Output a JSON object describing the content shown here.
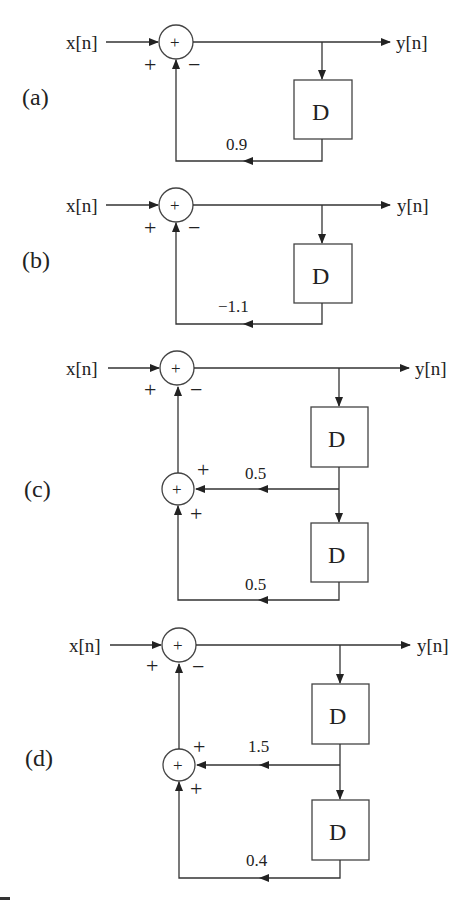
{
  "diagrams": [
    {
      "id": "a",
      "label": "(a)",
      "input": "x[n]",
      "output": "y[n]",
      "top_sum": {
        "plus": "+",
        "minus": "−",
        "glyph": "+"
      },
      "delays": [
        "D"
      ],
      "gains": [
        "0.9"
      ]
    },
    {
      "id": "b",
      "label": "(b)",
      "input": "x[n]",
      "output": "y[n]",
      "top_sum": {
        "plus": "+",
        "minus": "−",
        "glyph": "+"
      },
      "delays": [
        "D"
      ],
      "gains": [
        "−1.1"
      ]
    },
    {
      "id": "c",
      "label": "(c)",
      "input": "x[n]",
      "output": "y[n]",
      "top_sum": {
        "plus": "+",
        "minus": "−",
        "glyph": "+"
      },
      "inner_sum": {
        "plus_top": "+",
        "plus_bottom": "+",
        "glyph": "+"
      },
      "delays": [
        "D",
        "D"
      ],
      "gains": [
        "0.5",
        "0.5"
      ]
    },
    {
      "id": "d",
      "label": "(d)",
      "input": "x[n]",
      "output": "y[n]",
      "top_sum": {
        "plus": "+",
        "minus": "−",
        "glyph": "+"
      },
      "inner_sum": {
        "plus_top": "+",
        "plus_bottom": "+",
        "glyph": "+"
      },
      "delays": [
        "D",
        "D"
      ],
      "gains": [
        "1.5",
        "0.4"
      ]
    }
  ],
  "colors": {
    "line": "#333333",
    "background": "#ffffff"
  }
}
